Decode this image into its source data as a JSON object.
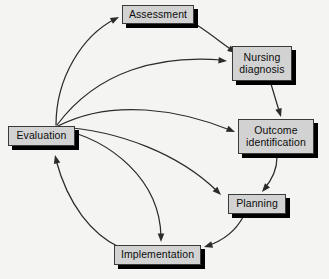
{
  "diagram": {
    "type": "cycle-flow-diagram",
    "background_color": "#f4f4f2",
    "node_fill_color": "#d2d2d2",
    "node_border_color": "#3a3a3a",
    "shadow_color": "#000000",
    "arrow_color": "#2b2b2b"
  },
  "nodes": [
    {
      "id": "assessment",
      "label": "Assessment",
      "x": 122,
      "y": 5,
      "width": 72,
      "height": 19,
      "font_size": 10.5
    },
    {
      "id": "nursing-diagnosis",
      "label": "Nursing\ndiagnosis",
      "x": 232,
      "y": 46,
      "width": 60,
      "height": 35,
      "font_size": 10.5
    },
    {
      "id": "outcome-identification",
      "label": "Outcome\nidentification",
      "x": 238,
      "y": 119,
      "width": 76,
      "height": 35,
      "font_size": 10.5
    },
    {
      "id": "planning",
      "label": "Planning",
      "x": 228,
      "y": 194,
      "width": 58,
      "height": 20,
      "font_size": 10.5
    },
    {
      "id": "implementation",
      "label": "Implementation",
      "x": 114,
      "y": 245,
      "width": 87,
      "height": 20,
      "font_size": 10.5
    },
    {
      "id": "evaluation",
      "label": "Evaluation",
      "x": 8,
      "y": 126,
      "width": 67,
      "height": 20,
      "font_size": 10.5
    }
  ],
  "edges": [
    {
      "id": "assessment-to-nursing-diagnosis",
      "from": "assessment",
      "to": "nursing-diagnosis",
      "kind": "cycle",
      "path": "M 197 25 C 215 37 224 45 235 52",
      "arrow_at": [
        236,
        53
      ],
      "arrow_angle": 34
    },
    {
      "id": "nursing-diagnosis-to-outcome-identification",
      "from": "nursing-diagnosis",
      "to": "outcome-identification",
      "kind": "cycle",
      "path": "M 271 84 C 274 94 277 104 280 114",
      "arrow_at": [
        281,
        117
      ],
      "arrow_angle": 73
    },
    {
      "id": "outcome-identification-to-planning",
      "from": "outcome-identification",
      "to": "planning",
      "kind": "cycle",
      "path": "M 277 157 C 277 170 272 180 264 189",
      "arrow_at": [
        262,
        192
      ],
      "arrow_angle": 130
    },
    {
      "id": "planning-to-implementation",
      "from": "planning",
      "to": "implementation",
      "kind": "cycle",
      "path": "M 243 217 C 235 232 222 241 207 246",
      "arrow_at": [
        204,
        247
      ],
      "arrow_angle": 163
    },
    {
      "id": "implementation-to-evaluation",
      "from": "implementation",
      "to": "evaluation",
      "kind": "cycle",
      "path": "M 119 247 C 92 234 68 205 56 160",
      "arrow_at": [
        55,
        155
      ],
      "arrow_angle": -104
    },
    {
      "id": "evaluation-to-assessment",
      "from": "evaluation",
      "to": "assessment",
      "kind": "fan",
      "path": "M 56 125 C 56 78 82 36 115 19",
      "arrow_at": [
        119,
        17
      ],
      "arrow_angle": -27
    },
    {
      "id": "evaluation-to-nursing-diagnosis",
      "from": "evaluation",
      "to": "nursing-diagnosis",
      "kind": "fan",
      "path": "M 57 125 C 98 70 160 55 222 60",
      "arrow_at": [
        227,
        61
      ],
      "arrow_angle": 5
    },
    {
      "id": "evaluation-to-outcome-identification",
      "from": "evaluation",
      "to": "outcome-identification",
      "kind": "fan",
      "path": "M 58 126 C 112 98 180 110 230 130",
      "arrow_at": [
        235,
        132
      ],
      "arrow_angle": 23
    },
    {
      "id": "evaluation-to-planning",
      "from": "evaluation",
      "to": "planning",
      "kind": "fan",
      "path": "M 58 127 C 120 130 180 155 217 191",
      "arrow_at": [
        221,
        195
      ],
      "arrow_angle": 45
    },
    {
      "id": "evaluation-to-implementation",
      "from": "evaluation",
      "to": "implementation",
      "kind": "fan",
      "path": "M 57 128 C 112 140 160 180 161 237",
      "arrow_at": [
        161,
        242
      ],
      "arrow_angle": 90
    }
  ]
}
